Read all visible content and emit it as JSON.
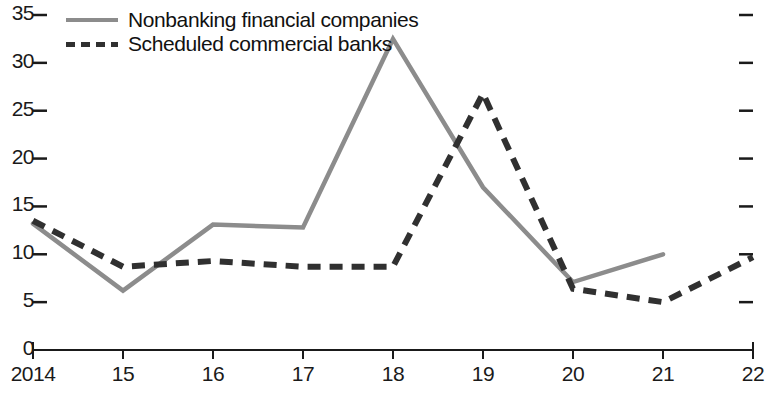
{
  "chart_data": {
    "type": "line",
    "title": "",
    "subtitle": "",
    "xlabel": "",
    "ylabel": "",
    "x": [
      "2014",
      "15",
      "16",
      "17",
      "18",
      "19",
      "20",
      "21",
      "22"
    ],
    "xlim": [
      2014,
      2022
    ],
    "ylim": [
      0,
      35
    ],
    "yticks": [
      0,
      5,
      10,
      15,
      20,
      25,
      30,
      35
    ],
    "ytick_labels": [
      "0",
      "5",
      "10",
      "15",
      "20",
      "25",
      "30",
      "35"
    ],
    "xtick_labels": [
      "2014",
      "15",
      "16",
      "17",
      "18",
      "19",
      "20",
      "21",
      "22"
    ],
    "grid": false,
    "legend_position": "top-left",
    "right_axis_ticks": true,
    "right_axis_labels": false,
    "series": [
      {
        "name": "Nonbanking financial companies",
        "style": "solid",
        "color": "#8c8c8c",
        "x": [
          "2014",
          "15",
          "16",
          "17",
          "18",
          "19",
          "20",
          "21"
        ],
        "values": [
          13.2,
          6.2,
          13.1,
          12.8,
          32.5,
          17.0,
          7.1,
          10.0
        ]
      },
      {
        "name": "Scheduled commercial banks",
        "style": "dashed",
        "color": "#303030",
        "x": [
          "2014",
          "15",
          "16",
          "17",
          "18",
          "19",
          "20",
          "21",
          "22"
        ],
        "values": [
          13.5,
          8.7,
          9.3,
          8.7,
          8.7,
          26.8,
          6.4,
          5.0,
          9.7
        ]
      }
    ]
  },
  "legend": {
    "items": [
      {
        "label": "Nonbanking financial companies",
        "style": "solid"
      },
      {
        "label": "Scheduled commercial banks",
        "style": "dashed"
      }
    ]
  },
  "colors": {
    "series_solid": "#8c8c8c",
    "series_dashed": "#303030",
    "axis": "#1a1a1a",
    "text": "#111111",
    "background": "#ffffff"
  }
}
